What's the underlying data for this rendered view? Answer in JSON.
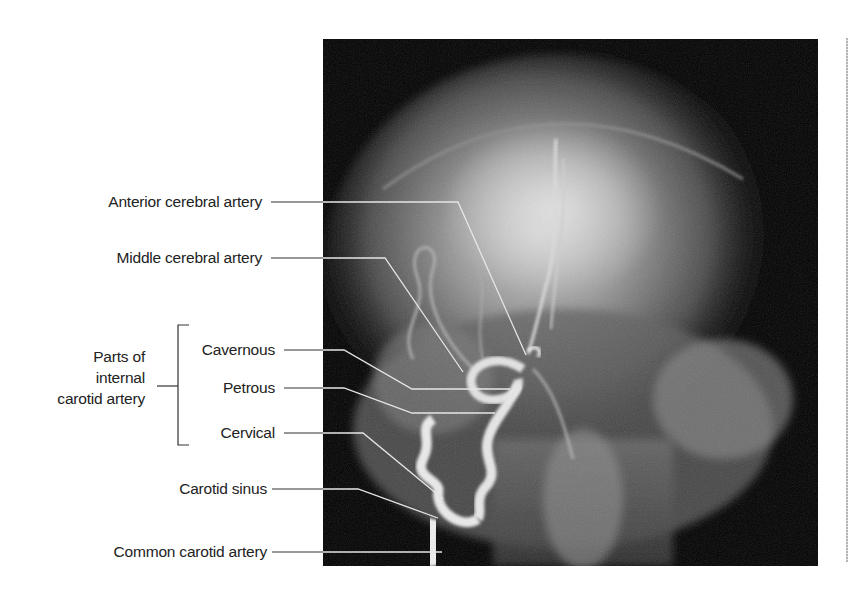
{
  "figure": {
    "labels": {
      "anterior_cerebral": "Anterior cerebral artery",
      "middle_cerebral": "Middle cerebral artery",
      "group_line1": "Parts of",
      "group_line2": "internal",
      "group_line3": "carotid artery",
      "cavernous": "Cavernous",
      "petrous": "Petrous",
      "cervical": "Cervical",
      "carotid_sinus": "Carotid sinus",
      "common_carotid": "Common carotid artery"
    },
    "colors": {
      "leader_line_outside": "#333333",
      "leader_line_inside": "#e8e8e8",
      "image_background": "#000000"
    }
  }
}
